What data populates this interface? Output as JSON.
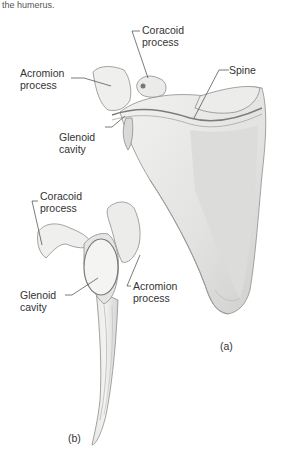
{
  "caption": "the humerus.",
  "figure": {
    "view_a": {
      "panel_label": "(a)",
      "labels": [
        {
          "id": "coracoid",
          "line1": "Coracoid",
          "line2": "process"
        },
        {
          "id": "acromion",
          "line1": "Acromion",
          "line2": "process"
        },
        {
          "id": "spine",
          "line1": "Spine",
          "line2": ""
        },
        {
          "id": "glenoid",
          "line1": "Glenoid",
          "line2": "cavity"
        }
      ]
    },
    "view_b": {
      "panel_label": "(b)",
      "labels": [
        {
          "id": "coracoid",
          "line1": "Coracoid",
          "line2": "process"
        },
        {
          "id": "glenoid",
          "line1": "Glenoid",
          "line2": "cavity"
        },
        {
          "id": "acromion",
          "line1": "Acromion",
          "line2": "process"
        }
      ]
    }
  }
}
